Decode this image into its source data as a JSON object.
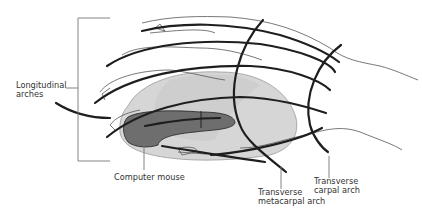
{
  "diagram": {
    "labels": {
      "longitudinal": [
        "Longitudinal",
        "arches"
      ],
      "mouse": "Computer mouse",
      "metacarpal": [
        "Transverse",
        "metacarpal arch"
      ],
      "carpal": [
        "Transverse",
        "carpal arch"
      ]
    },
    "colors": {
      "arch_line": "#1e1e1e",
      "hand_outline": "#555555",
      "mouse_body": "#d3d3d3",
      "mouse_dark": "#6b6b6b",
      "leader": "#777777",
      "text": "#333333"
    }
  }
}
